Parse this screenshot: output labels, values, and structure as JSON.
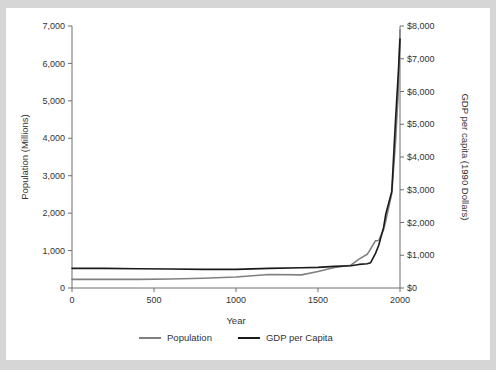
{
  "figure": {
    "background_color": "#d6d6d6",
    "card_color": "#ffffff"
  },
  "chart_data": {
    "type": "line",
    "title": "",
    "xlabel": "Year",
    "ylabel": "Population (Millions)",
    "y2label": "GDP per capita (1990 Dollars)",
    "xlim": [
      0,
      2000
    ],
    "ylim": [
      0,
      7000
    ],
    "y2lim": [
      0,
      8000
    ],
    "grid": false,
    "legend_position": "bottom-center",
    "xticks": [
      0,
      500,
      1000,
      1500,
      2000
    ],
    "xticklabels": [
      "0",
      "500",
      "1000",
      "1500",
      "2000"
    ],
    "yticks": [
      0,
      1000,
      2000,
      3000,
      4000,
      5000,
      6000,
      7000
    ],
    "yticklabels": [
      "0",
      "1,000",
      "2,000",
      "3,000",
      "4,000",
      "5,000",
      "6,000",
      "7,000"
    ],
    "y2ticks": [
      0,
      1000,
      2000,
      3000,
      4000,
      5000,
      6000,
      7000,
      8000
    ],
    "y2ticklabels": [
      "$0",
      "$1,000",
      "$2,000",
      "$3,000",
      "$4,000",
      "$5,000",
      "$6,000",
      "$7,000",
      "$8,000"
    ],
    "series": [
      {
        "name": "Population",
        "axis": "left",
        "color": "#808080",
        "unit": "Millions",
        "x": [
          0,
          200,
          400,
          600,
          800,
          1000,
          1200,
          1400,
          1500,
          1600,
          1700,
          1750,
          1800,
          1820,
          1850,
          1870,
          1900,
          1913,
          1950,
          1973,
          1990,
          2000
        ],
        "values": [
          230,
          230,
          230,
          240,
          260,
          295,
          360,
          350,
          440,
          550,
          610,
          770,
          900,
          1040,
          1260,
          1270,
          1560,
          1790,
          2530,
          3920,
          5280,
          6900
        ]
      },
      {
        "name": "GDP per Capita",
        "axis": "right",
        "color": "#1a1a1a",
        "unit": "1990 Dollars",
        "x": [
          0,
          200,
          400,
          600,
          800,
          1000,
          1200,
          1400,
          1500,
          1600,
          1700,
          1750,
          1800,
          1820,
          1850,
          1870,
          1900,
          1913,
          1950,
          1973,
          1990,
          2000
        ],
        "values": [
          600,
          600,
          590,
          580,
          570,
          570,
          600,
          620,
          630,
          660,
          680,
          720,
          740,
          770,
          1050,
          1300,
          1850,
          2250,
          2950,
          5150,
          6600,
          7600
        ]
      }
    ],
    "legend": [
      {
        "label": "Population",
        "color": "#808080"
      },
      {
        "label": "GDP per Capita",
        "color": "#1a1a1a"
      }
    ]
  }
}
